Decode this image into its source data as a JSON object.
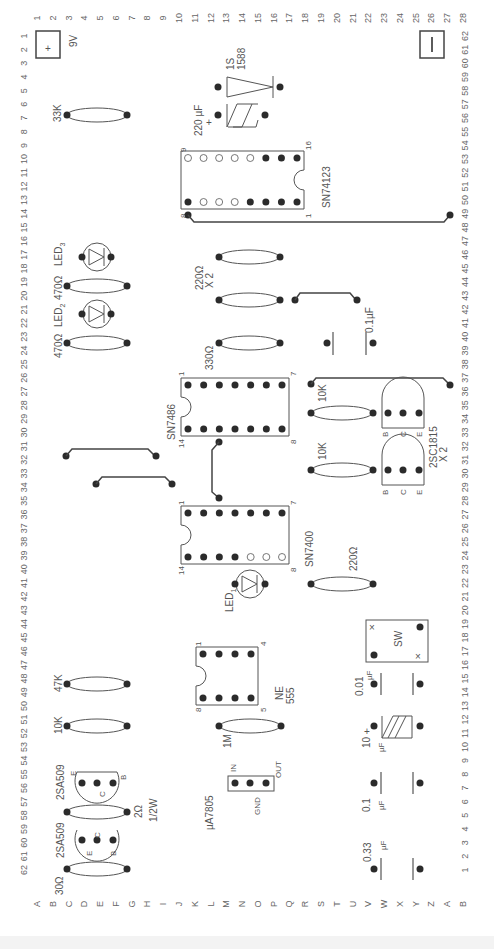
{
  "board": {
    "top_columns": [
      "1",
      "2",
      "3",
      "4",
      "5",
      "6",
      "7",
      "8",
      "9",
      "10",
      "11",
      "12",
      "13",
      "14",
      "15",
      "16",
      "17",
      "18",
      "19",
      "20",
      "21",
      "22",
      "23",
      "24",
      "25",
      "26",
      "27",
      "28"
    ],
    "left_rows": [
      "1",
      "2",
      "3",
      "4",
      "5",
      "6",
      "7",
      "8",
      "9",
      "10",
      "11",
      "12",
      "13",
      "14",
      "15",
      "16",
      "17",
      "18",
      "19",
      "20",
      "21",
      "22",
      "23",
      "24",
      "25",
      "26",
      "27",
      "28",
      "29",
      "30",
      "31",
      "32",
      "33",
      "34",
      "35",
      "36",
      "37",
      "38",
      "39",
      "40",
      "41",
      "42",
      "43",
      "44",
      "45",
      "46",
      "47",
      "48",
      "49",
      "50",
      "51",
      "52",
      "53",
      "54",
      "55",
      "56",
      "57",
      "58",
      "59",
      "60",
      "61",
      "62"
    ],
    "right_rows": [
      "62",
      "61",
      "60",
      "59",
      "58",
      "57",
      "56",
      "55",
      "54",
      "53",
      "52",
      "51",
      "50",
      "49",
      "48",
      "47",
      "46",
      "45",
      "44",
      "43",
      "42",
      "41",
      "40",
      "39",
      "38",
      "37",
      "36",
      "35",
      "34",
      "33",
      "32",
      "31",
      "30",
      "29",
      "28",
      "27",
      "26",
      "25",
      "24",
      "23",
      "22",
      "21",
      "20",
      "19",
      "18",
      "17",
      "16",
      "15",
      "14",
      "13",
      "12",
      "11",
      "10",
      "9",
      "8",
      "7",
      "6",
      "5",
      "4",
      "3",
      "2",
      "1"
    ],
    "bottom_letters": [
      "A",
      "B",
      "C",
      "D",
      "E",
      "F",
      "G",
      "H",
      "I",
      "J",
      "K",
      "L",
      "M",
      "N",
      "O",
      "P",
      "Q",
      "R",
      "S",
      "T",
      "U",
      "V",
      "W",
      "X",
      "Y",
      "Z",
      "A",
      "B"
    ],
    "bottom_left_corner": "62",
    "bottom_right_corner": "1",
    "top_right_corner": "28"
  },
  "power": {
    "plus_symbol": "+",
    "minus_symbol": "—",
    "voltage": "9V"
  },
  "components": {
    "diode": {
      "line1": "1S",
      "line2": "1588"
    },
    "cap_220": {
      "value": "220 µF",
      "polarity": "+"
    },
    "r_33k": "33K",
    "ic_74123": {
      "name": "SN74123",
      "pin_tl": "9",
      "pin_tr": "16",
      "pin_bl": "8",
      "pin_br": "1"
    },
    "led3": {
      "label": "LED",
      "sub": "3",
      "resistor": "470Ω"
    },
    "led2": {
      "label": "LED",
      "sub": "2",
      "resistor": "470Ω"
    },
    "r_220x2": {
      "line1": "220Ω",
      "line2": "X 2"
    },
    "cap_01": "0.1µF",
    "r_330": "330Ω",
    "ic_7486": {
      "name": "SN7486",
      "pin_tl": "1",
      "pin_tr": "7",
      "pin_bl": "14",
      "pin_br": "8"
    },
    "r_10k_a": "10K",
    "r_10k_b": "10K",
    "tr_2sc1815": {
      "name": "2SC1815",
      "count": "X 2",
      "b": "B",
      "c": "C",
      "e": "E"
    },
    "ic_7400": {
      "name": "SN7400",
      "pin_tl": "1",
      "pin_tr": "7",
      "pin_bl": "14",
      "pin_br": "8"
    },
    "r_220": "220Ω",
    "led1": {
      "label": "LED",
      "sub": "1"
    },
    "sw": {
      "label": "SW",
      "x": "×"
    },
    "r_47k": "47K",
    "ic_555": {
      "line1": "NE",
      "line2": "555",
      "pin_tl": "1",
      "pin_tr": "4",
      "pin_bl": "8",
      "pin_br": "5"
    },
    "cap_001": {
      "value": "0.01",
      "unit": "µF"
    },
    "r_10k_c": "10K",
    "r_1m": "1M",
    "cap_10": {
      "value": "10",
      "unit": "µF",
      "polarity": "+"
    },
    "tr_2sa509_a": {
      "name": "2SA509",
      "e": "E",
      "c": "C",
      "b": "B"
    },
    "reg_7805": {
      "name": "µA7805",
      "in": "IN",
      "gnd": "GND",
      "out": "OUT"
    },
    "cap_01b": {
      "value": "0.1",
      "unit": "µF"
    },
    "r_2": {
      "line1": "2Ω",
      "line2": "1/2W"
    },
    "tr_2sa509_b": {
      "name": "2SA509",
      "e": "E",
      "c": "C",
      "b": "B"
    },
    "r_30": "30Ω",
    "cap_033": {
      "value": "0.33",
      "unit": "µF"
    }
  },
  "colors": {
    "ink": "#444444",
    "dot": "#2b2b2b",
    "label": "#555555"
  }
}
